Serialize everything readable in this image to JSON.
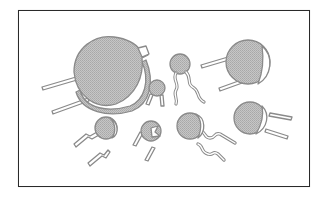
{
  "figure": {
    "frame": {
      "border_color": "#2a2a2a",
      "background": "#ffffff"
    },
    "colors": {
      "body_fill": "#bdbdbd",
      "outline": "#8a8a8a",
      "lead_fill": "#ffffff"
    },
    "components": [
      {
        "id": "large-disc-left",
        "size": "large"
      },
      {
        "id": "large-disc-right",
        "size": "large"
      },
      {
        "id": "small-bead-top-center",
        "size": "small"
      },
      {
        "id": "tiny-disc-center",
        "size": "tiny"
      },
      {
        "id": "small-disc-bottom-left",
        "size": "small"
      },
      {
        "id": "small-disc-bottom-center",
        "size": "small"
      },
      {
        "id": "small-disc-bottom-right",
        "size": "small"
      },
      {
        "id": "medium-disc-right",
        "size": "medium"
      }
    ]
  }
}
